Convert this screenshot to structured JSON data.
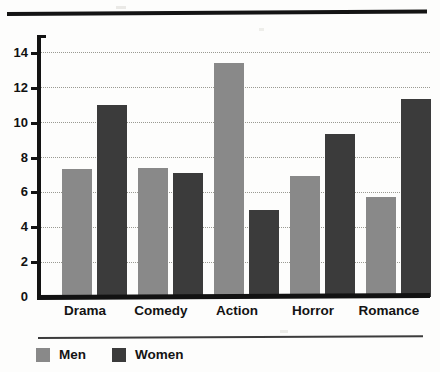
{
  "chart_data": {
    "type": "bar",
    "title": "",
    "subtitle": "",
    "xlabel": "",
    "ylabel": "",
    "categories": [
      "Drama",
      "Comedy",
      "Action",
      "Horror",
      "Romance"
    ],
    "series": [
      {
        "name": "Men",
        "color": "#898989",
        "values": [
          7.3,
          7.4,
          13.4,
          6.9,
          5.7
        ]
      },
      {
        "name": "Women",
        "color": "#3b3b3b",
        "values": [
          11.0,
          7.1,
          5.0,
          9.3,
          11.3
        ]
      }
    ],
    "ylim": [
      0,
      14.8
    ],
    "yticks": [
      0,
      2,
      4,
      6,
      8,
      10,
      12,
      14
    ],
    "ytick_labels": [
      "0",
      "2",
      "4",
      "6",
      "8",
      "10",
      "12",
      "14"
    ],
    "grid": true,
    "grid_style": "dotted",
    "legend_position": "bottom-left",
    "annotations": []
  },
  "legend": {
    "items": [
      {
        "label": "Men",
        "swatch": "men"
      },
      {
        "label": "Women",
        "swatch": "women"
      }
    ]
  },
  "axis": {
    "y_labels": [
      "14",
      "12",
      "10",
      "8",
      "6",
      "4",
      "2",
      "0"
    ]
  },
  "colors": {
    "men": "#898989",
    "women": "#3b3b3b",
    "axis": "#121212",
    "grid": "#9a9a92",
    "background": "#fdfdfc"
  }
}
